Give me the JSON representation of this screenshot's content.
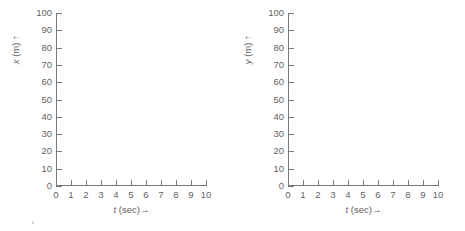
{
  "figure": {
    "background_color": "#ffffff",
    "axis_color": "#787878",
    "text_color": "#5f5f5f"
  },
  "chart_data": [
    {
      "type": "line",
      "panel": "left",
      "title": "",
      "xlabel": "t (sec)",
      "xlabel_variable": "t",
      "xlabel_unit": "(sec)",
      "xlabel_arrow": "→",
      "ylabel": "x (m)",
      "ylabel_variable": "x",
      "ylabel_unit": "(m)",
      "ylabel_arrow": "↑",
      "x": [],
      "values": [],
      "series": [],
      "xlim": [
        0,
        10
      ],
      "ylim": [
        0,
        100
      ],
      "xticks": [
        0,
        1,
        2,
        3,
        4,
        5,
        6,
        7,
        8,
        9,
        10
      ],
      "xticklabels": [
        "0",
        "1",
        "2",
        "3",
        "4",
        "5",
        "6",
        "7",
        "8",
        "9",
        "10"
      ],
      "yticks": [
        0,
        10,
        20,
        30,
        40,
        50,
        60,
        70,
        80,
        90,
        100
      ],
      "yticklabels": [
        "0",
        "10",
        "20",
        "30",
        "40",
        "50",
        "60",
        "70",
        "80",
        "90",
        "100"
      ],
      "grid": false,
      "legend": null,
      "annotations": []
    },
    {
      "type": "line",
      "panel": "right",
      "title": "",
      "xlabel": "t (sec)",
      "xlabel_variable": "t",
      "xlabel_unit": "(sec)",
      "xlabel_arrow": "→",
      "ylabel": "y (m)",
      "ylabel_variable": "y",
      "ylabel_unit": "(m)",
      "ylabel_arrow": "↑",
      "x": [],
      "values": [],
      "series": [],
      "xlim": [
        0,
        10
      ],
      "ylim": [
        0,
        100
      ],
      "xticks": [
        0,
        1,
        2,
        3,
        4,
        5,
        6,
        7,
        8,
        9,
        10
      ],
      "xticklabels": [
        "0",
        "1",
        "2",
        "3",
        "4",
        "5",
        "6",
        "7",
        "8",
        "9",
        "10"
      ],
      "yticks": [
        0,
        10,
        20,
        30,
        40,
        50,
        60,
        70,
        80,
        90,
        100
      ],
      "yticklabels": [
        "0",
        "10",
        "20",
        "30",
        "40",
        "50",
        "60",
        "70",
        "80",
        "90",
        "100"
      ],
      "grid": false,
      "legend": null,
      "annotations": []
    }
  ]
}
